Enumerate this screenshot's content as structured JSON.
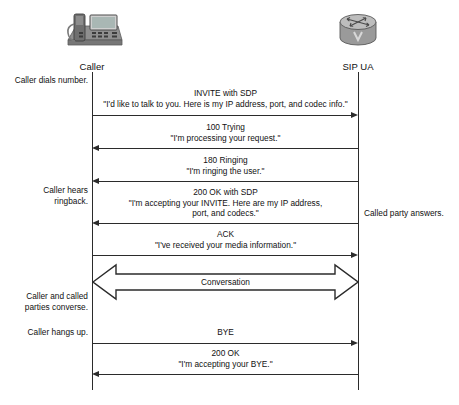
{
  "diagram": {
    "type": "sequence",
    "endpoints": [
      {
        "id": "caller",
        "label": "Caller",
        "icon": "ip-phone-icon"
      },
      {
        "id": "sip_ua",
        "label": "SIP UA",
        "icon": "router-icon"
      }
    ],
    "left_notes": [
      {
        "text": "Caller dials number."
      },
      {
        "line1": "Caller hears",
        "line2": "ringback."
      },
      {
        "line1": "Caller and called",
        "line2": "parties converse."
      },
      {
        "text": "Caller hangs up."
      }
    ],
    "right_notes": [
      {
        "text": "Called party answers."
      }
    ],
    "messages": [
      {
        "id": "invite",
        "title": "INVITE with SDP",
        "quote": "\"I'd like to talk to you. Here is my IP address, port, and codec info.\"",
        "direction": "right"
      },
      {
        "id": "trying_100",
        "title": "100 Trying",
        "quote": "\"I'm processing your request.\"",
        "direction": "left"
      },
      {
        "id": "ringing_180",
        "title": "180 Ringing",
        "quote": "\"I'm ringing the user.\"",
        "direction": "left"
      },
      {
        "id": "ok_200_sdp",
        "title": "200 OK with SDP",
        "quote": "\"I'm accepting your INVITE. Here are my IP address,",
        "quote2": "port, and codecs.\"",
        "direction": "left"
      },
      {
        "id": "ack",
        "title": "ACK",
        "quote": "\"I've received your media information.\"",
        "direction": "right"
      },
      {
        "id": "conversation",
        "title": "Conversation",
        "direction": "both",
        "style": "block-arrow"
      },
      {
        "id": "bye",
        "title": "BYE",
        "direction": "right"
      },
      {
        "id": "ok_200",
        "title": "200 OK",
        "quote": "\"I'm accepting your BYE.\"",
        "direction": "left"
      }
    ],
    "colors": {
      "line": "#2b2b2b",
      "text": "#111111",
      "background": "#ffffff"
    }
  }
}
